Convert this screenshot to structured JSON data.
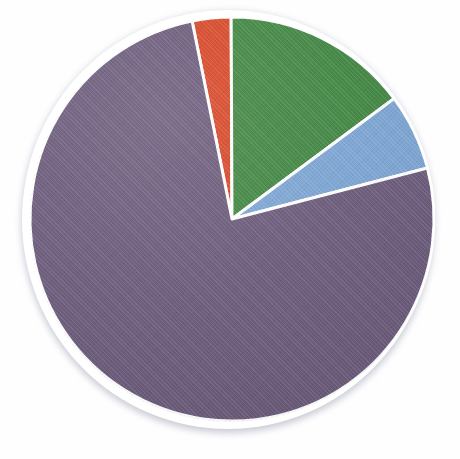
{
  "chart_data": {
    "type": "pie",
    "title": "",
    "subtitle": "",
    "xlabel": "",
    "ylabel": "",
    "grid": false,
    "legend": "none",
    "start_angle_deg": 348.6,
    "direction": "clockwise",
    "categories": [
      "Red",
      "Green",
      "Blue",
      "Purple"
    ],
    "values": [
      3.1,
      14.9,
      6.1,
      75.9
    ],
    "units": "percent",
    "colors": [
      "#d74525",
      "#3f8540",
      "#7ba4d2",
      "#6a5a7a"
    ],
    "slices": [
      {
        "label": "Red",
        "value": 3.1,
        "angle_deg": 11,
        "color": "#d74525",
        "start_deg": 348.6,
        "end_deg": 359.6
      },
      {
        "label": "Green",
        "value": 14.9,
        "angle_deg": 54,
        "color": "#3f8540",
        "start_deg": 359.6,
        "end_deg": 53.6
      },
      {
        "label": "Blue",
        "value": 6.1,
        "angle_deg": 22,
        "color": "#7ba4d2",
        "start_deg": 53.6,
        "end_deg": 75.6
      },
      {
        "label": "Purple",
        "value": 75.9,
        "angle_deg": 273,
        "color": "#6a5a7a",
        "start_deg": 75.6,
        "end_deg": 348.6
      }
    ],
    "annotations": [],
    "data_labels": false,
    "slice_separator_color": "#ffffff",
    "background_color": "#ffffff"
  },
  "figure": {
    "center_x": 232,
    "center_y": 219,
    "radius": 202,
    "separator_width_px": 3,
    "has_drop_shadow": true,
    "shadow_color": "#c9ccd6"
  }
}
